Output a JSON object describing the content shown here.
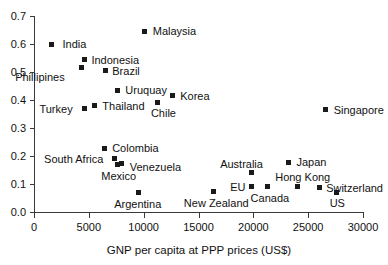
{
  "chart_data": {
    "type": "scatter",
    "title": "",
    "subtitle": "",
    "xlabel": "GNP per capita at PPP prices (US$)",
    "ylabel": "",
    "xlim": [
      0,
      30000
    ],
    "ylim": [
      0.0,
      0.7
    ],
    "grid": false,
    "legend": "none",
    "xticks": [
      "0",
      "5000",
      "10000",
      "15000",
      "20000",
      "25000",
      "30000"
    ],
    "xtick_values": [
      0,
      5000,
      10000,
      15000,
      20000,
      25000,
      30000
    ],
    "yticks": [
      "0.0",
      "0.1",
      "0.2",
      "0.3",
      "0.4",
      "0.5",
      "0.6",
      "0.7"
    ],
    "ytick_values": [
      0.0,
      0.1,
      0.2,
      0.3,
      0.4,
      0.5,
      0.6,
      0.7
    ],
    "marker": "filled-square",
    "marker_color": "#1a1a1a",
    "points": [
      {
        "label": "India",
        "x": 1600,
        "y": 0.6,
        "lx": 11,
        "ly": -5
      },
      {
        "label": "Indonesia",
        "x": 4600,
        "y": 0.545,
        "lx": 7,
        "ly": -4
      },
      {
        "label": "Phillipines",
        "x": 4300,
        "y": 0.515,
        "lx": -66,
        "ly": 4
      },
      {
        "label": "Brazil",
        "x": 6500,
        "y": 0.505,
        "lx": 7,
        "ly": -5
      },
      {
        "label": "Malaysia",
        "x": 10100,
        "y": 0.645,
        "lx": 8,
        "ly": -5
      },
      {
        "label": "Uruquay",
        "x": 7600,
        "y": 0.435,
        "lx": 8,
        "ly": -5
      },
      {
        "label": "Korea",
        "x": 12600,
        "y": 0.415,
        "lx": 8,
        "ly": -5
      },
      {
        "label": "Thailand",
        "x": 5500,
        "y": 0.38,
        "lx": 8,
        "ly": -5
      },
      {
        "label": "Turkey",
        "x": 4600,
        "y": 0.37,
        "lx": -45,
        "ly": -4
      },
      {
        "label": "Chile",
        "x": 11300,
        "y": 0.392,
        "lx": -7,
        "ly": 6
      },
      {
        "label": "Singapore",
        "x": 26600,
        "y": 0.365,
        "lx": 8,
        "ly": -5
      },
      {
        "label": "Colombia",
        "x": 6400,
        "y": 0.228,
        "lx": 8,
        "ly": -5
      },
      {
        "label": "South Africa",
        "x": 7300,
        "y": 0.192,
        "lx": -70,
        "ly": -4
      },
      {
        "label": "Venezuela",
        "x": 8000,
        "y": 0.172,
        "lx": 8,
        "ly": -2
      },
      {
        "label": "Mexico",
        "x": 7600,
        "y": 0.168,
        "lx": -16,
        "ly": 6
      },
      {
        "label": "Japan",
        "x": 23200,
        "y": 0.178,
        "lx": 8,
        "ly": -5
      },
      {
        "label": "Hong Kong",
        "x": 24000,
        "y": 0.092,
        "lx": -22,
        "ly": -14
      },
      {
        "label": "Australia",
        "x": 19800,
        "y": 0.14,
        "lx": -31,
        "ly": -14
      },
      {
        "label": "EU",
        "x": 19800,
        "y": 0.092,
        "lx": -21,
        "ly": -4
      },
      {
        "label": "Switzerland",
        "x": 26000,
        "y": 0.088,
        "lx": 7,
        "ly": -4
      },
      {
        "label": "Canada",
        "x": 21300,
        "y": 0.09,
        "lx": -17,
        "ly": 6
      },
      {
        "label": "US",
        "x": 27600,
        "y": 0.07,
        "lx": -7,
        "ly": 6
      },
      {
        "label": "New Zealand",
        "x": 16400,
        "y": 0.073,
        "lx": -30,
        "ly": 6
      },
      {
        "label": "Argentina",
        "x": 9500,
        "y": 0.068,
        "lx": -24,
        "ly": 6
      }
    ]
  }
}
